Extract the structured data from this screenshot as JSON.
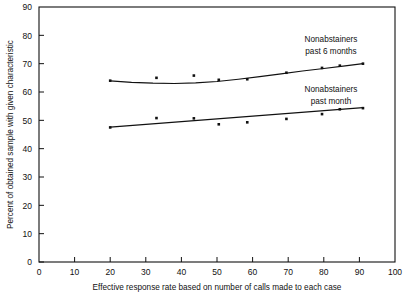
{
  "chart_data": {
    "type": "scatter",
    "title": "",
    "xlabel": "Effective response rate based on number of calls made to each case",
    "ylabel": "Percent of obtained sample with given characteristic",
    "xlim": [
      0,
      100
    ],
    "ylim": [
      0,
      90
    ],
    "xticks": [
      0,
      10,
      20,
      30,
      40,
      50,
      60,
      70,
      80,
      90,
      100
    ],
    "yticks": [
      0,
      10,
      20,
      30,
      40,
      50,
      60,
      70,
      80,
      90
    ],
    "grid": false,
    "legend_position": "inline-right",
    "series": [
      {
        "name": "Nonabstainers past 6 months",
        "label_line1": "Nonabstainers",
        "label_line2": "past 6 months",
        "marker": "square",
        "color": "#111111",
        "points": [
          {
            "x": 20.0,
            "y": 64.0
          },
          {
            "x": 33.0,
            "y": 65.0
          },
          {
            "x": 43.5,
            "y": 65.8
          },
          {
            "x": 50.5,
            "y": 64.3
          },
          {
            "x": 58.5,
            "y": 64.5
          },
          {
            "x": 69.5,
            "y": 66.8
          },
          {
            "x": 79.5,
            "y": 68.5
          },
          {
            "x": 84.5,
            "y": 69.3
          },
          {
            "x": 91.0,
            "y": 70.0
          }
        ],
        "fit_curve": [
          {
            "x": 20.0,
            "y": 63.9
          },
          {
            "x": 26.0,
            "y": 63.4
          },
          {
            "x": 32.0,
            "y": 63.1
          },
          {
            "x": 38.0,
            "y": 63.0
          },
          {
            "x": 44.0,
            "y": 63.2
          },
          {
            "x": 50.0,
            "y": 63.7
          },
          {
            "x": 56.0,
            "y": 64.5
          },
          {
            "x": 62.0,
            "y": 65.4
          },
          {
            "x": 68.0,
            "y": 66.4
          },
          {
            "x": 74.0,
            "y": 67.4
          },
          {
            "x": 80.0,
            "y": 68.3
          },
          {
            "x": 86.0,
            "y": 69.2
          },
          {
            "x": 91.0,
            "y": 70.0
          }
        ]
      },
      {
        "name": "Nonabstainers past month",
        "label_line1": "Nonabstainers",
        "label_line2": "past month",
        "marker": "square",
        "color": "#111111",
        "points": [
          {
            "x": 20.0,
            "y": 47.5
          },
          {
            "x": 33.0,
            "y": 50.8
          },
          {
            "x": 43.5,
            "y": 50.7
          },
          {
            "x": 50.5,
            "y": 48.6
          },
          {
            "x": 58.5,
            "y": 49.3
          },
          {
            "x": 69.5,
            "y": 50.5
          },
          {
            "x": 79.5,
            "y": 52.2
          },
          {
            "x": 84.5,
            "y": 53.9
          },
          {
            "x": 91.0,
            "y": 54.3
          }
        ],
        "fit_curve": [
          {
            "x": 20.0,
            "y": 47.6
          },
          {
            "x": 91.0,
            "y": 54.5
          }
        ]
      }
    ]
  }
}
